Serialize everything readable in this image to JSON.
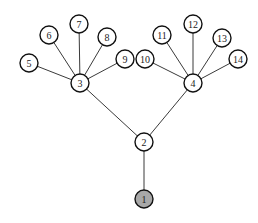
{
  "diagram": {
    "type": "tree",
    "node_radius": 9,
    "colors": {
      "default_fill": "#ffffff",
      "root_fill": "#a8a8a8",
      "stroke": "#111111",
      "edge": "#3a3a3a"
    },
    "nodes": [
      {
        "id": "1",
        "label": "1",
        "x": 144,
        "y": 199,
        "fill": "#a8a8a8"
      },
      {
        "id": "2",
        "label": "2",
        "x": 144,
        "y": 142,
        "fill": "#ffffff"
      },
      {
        "id": "3",
        "label": "3",
        "x": 80,
        "y": 83,
        "fill": "#ffffff"
      },
      {
        "id": "4",
        "label": "4",
        "x": 193,
        "y": 83,
        "fill": "#ffffff"
      },
      {
        "id": "5",
        "label": "5",
        "x": 29,
        "y": 63,
        "fill": "#ffffff"
      },
      {
        "id": "6",
        "label": "6",
        "x": 49,
        "y": 35,
        "fill": "#ffffff"
      },
      {
        "id": "7",
        "label": "7",
        "x": 79,
        "y": 24,
        "fill": "#ffffff"
      },
      {
        "id": "8",
        "label": "8",
        "x": 107,
        "y": 37,
        "fill": "#ffffff"
      },
      {
        "id": "9",
        "label": "9",
        "x": 125,
        "y": 59,
        "fill": "#ffffff"
      },
      {
        "id": "10",
        "label": "10",
        "x": 145,
        "y": 59,
        "fill": "#ffffff"
      },
      {
        "id": "11",
        "label": "11",
        "x": 162,
        "y": 35,
        "fill": "#ffffff"
      },
      {
        "id": "12",
        "label": "12",
        "x": 193,
        "y": 24,
        "fill": "#ffffff"
      },
      {
        "id": "13",
        "label": "13",
        "x": 222,
        "y": 38,
        "fill": "#ffffff"
      },
      {
        "id": "14",
        "label": "14",
        "x": 238,
        "y": 59,
        "fill": "#ffffff"
      }
    ],
    "edges": [
      {
        "from": "1",
        "to": "2"
      },
      {
        "from": "2",
        "to": "3"
      },
      {
        "from": "2",
        "to": "4"
      },
      {
        "from": "3",
        "to": "5"
      },
      {
        "from": "3",
        "to": "6"
      },
      {
        "from": "3",
        "to": "7"
      },
      {
        "from": "3",
        "to": "8"
      },
      {
        "from": "3",
        "to": "9"
      },
      {
        "from": "4",
        "to": "10"
      },
      {
        "from": "4",
        "to": "11"
      },
      {
        "from": "4",
        "to": "12"
      },
      {
        "from": "4",
        "to": "13"
      },
      {
        "from": "4",
        "to": "14"
      }
    ]
  }
}
